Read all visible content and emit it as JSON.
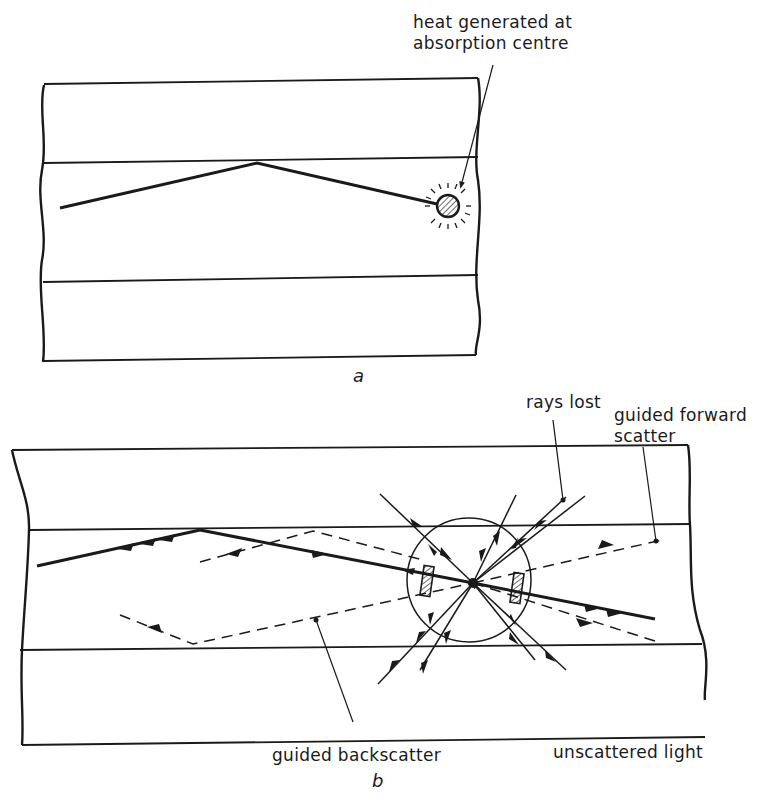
{
  "figure": {
    "panels": [
      {
        "id": "a",
        "caption": "a",
        "labels": {
          "heat": [
            "heat generated at",
            "absorption centre"
          ]
        },
        "elements": [
          "fibre cladding (top)",
          "fibre core",
          "fibre cladding (bottom)",
          "guided ray",
          "absorption centre"
        ]
      },
      {
        "id": "b",
        "caption": "b",
        "labels": {
          "rays_lost": "rays lost",
          "forward": [
            "guided forward",
            "scatter"
          ],
          "backscatter": "guided backscatter",
          "unscattered": "unscattered light"
        },
        "elements": [
          "fibre cladding (top)",
          "fibre core",
          "fibre cladding (bottom)",
          "incident ray",
          "scattering centre",
          "scattered rays",
          "guided forward scatter (dashed)",
          "guided backscatter (dashed)"
        ]
      }
    ],
    "colors": {
      "ink": "#1a1a1a",
      "paper": "#ffffff"
    }
  }
}
